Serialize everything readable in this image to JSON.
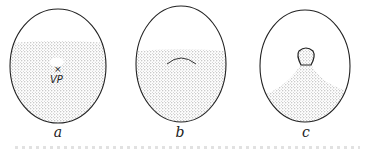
{
  "figure": {
    "colors": {
      "outline": "#222222",
      "stipple": "#9a9a9a",
      "background": "#ffffff"
    },
    "panels": [
      {
        "id": "a",
        "label": "a",
        "annotation": "VP",
        "marker": "×",
        "feature": "small clear vesicle above vegetal pole"
      },
      {
        "id": "b",
        "label": "b",
        "feature": "dome-shaped arc within stippled region"
      },
      {
        "id": "c",
        "label": "c",
        "feature": "knob-shaped structure with stippled cone extending to lower region"
      }
    ]
  }
}
